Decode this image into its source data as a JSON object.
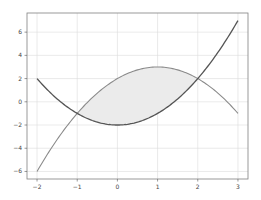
{
  "chart_data": {
    "type": "line",
    "title": "",
    "xlabel": "",
    "ylabel": "",
    "xlim": [
      -2.25,
      3.25
    ],
    "ylim": [
      -6.65,
      7.65
    ],
    "grid": true,
    "legend": null,
    "x_ticks": [
      -2,
      -1,
      0,
      1,
      2,
      3
    ],
    "y_ticks": [
      -6,
      -4,
      -2,
      0,
      2,
      4,
      6
    ],
    "x_tick_labels": [
      "−2",
      "−1",
      "0",
      "1",
      "2",
      "3"
    ],
    "y_tick_labels": [
      "−6",
      "−4",
      "−2",
      "0",
      "2",
      "4",
      "6"
    ],
    "series": [
      {
        "name": "f(x) = x^2 - 2",
        "color": "#555555",
        "x": [
          -2,
          -1.5,
          -1,
          -0.5,
          0,
          0.5,
          1,
          1.5,
          2,
          2.5,
          3
        ],
        "values": [
          2,
          0.25,
          -1,
          -1.75,
          -2,
          -1.75,
          -1,
          0.25,
          2,
          4.25,
          7
        ]
      },
      {
        "name": "g(x) = -x^2 + 2x + 2",
        "color": "#8a8a8a",
        "x": [
          -2,
          -1.5,
          -1,
          -0.5,
          0,
          0.5,
          1,
          1.5,
          2,
          2.5,
          3
        ],
        "values": [
          -6,
          -3.25,
          -1,
          0.75,
          2,
          2.75,
          3,
          2.75,
          2,
          0.75,
          -1
        ]
      }
    ],
    "fill_between": {
      "x_range": [
        -1,
        2
      ],
      "upper": "g(x)",
      "lower": "f(x)",
      "color": "#ebebeb"
    },
    "intersections": [
      {
        "x": -1,
        "y": -1
      },
      {
        "x": 2,
        "y": 2
      }
    ]
  },
  "colors": {
    "frame": "#808080",
    "grid": "#dcdcdc",
    "fill": "#ebebeb",
    "curve_f": "#555555",
    "curve_g": "#8a8a8a"
  }
}
